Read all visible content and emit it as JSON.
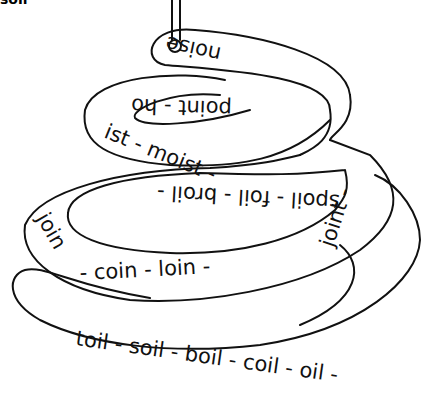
{
  "title_fragment": "soil",
  "coil": {
    "top_loop": [
      "noise"
    ],
    "second_loop": [
      "point",
      "hoist",
      "moist"
    ],
    "third_loop": [
      "spoil",
      "foil",
      "broil",
      "join",
      "coin",
      "loin",
      "joint"
    ],
    "bottom_loop": [
      "toil",
      "soil",
      "boil",
      "coil",
      "oil"
    ],
    "separator": "-"
  },
  "labels": {
    "noise": "noise",
    "point_hoist": "point - ho",
    "ist_moist": "ist - moist -",
    "spoil_row": "spoil - foil - broil -",
    "join": "join",
    "coin_row": "- coin - loin -",
    "joint": "joint -",
    "toil_row": "toil - soil - boil - coil - oil -"
  }
}
